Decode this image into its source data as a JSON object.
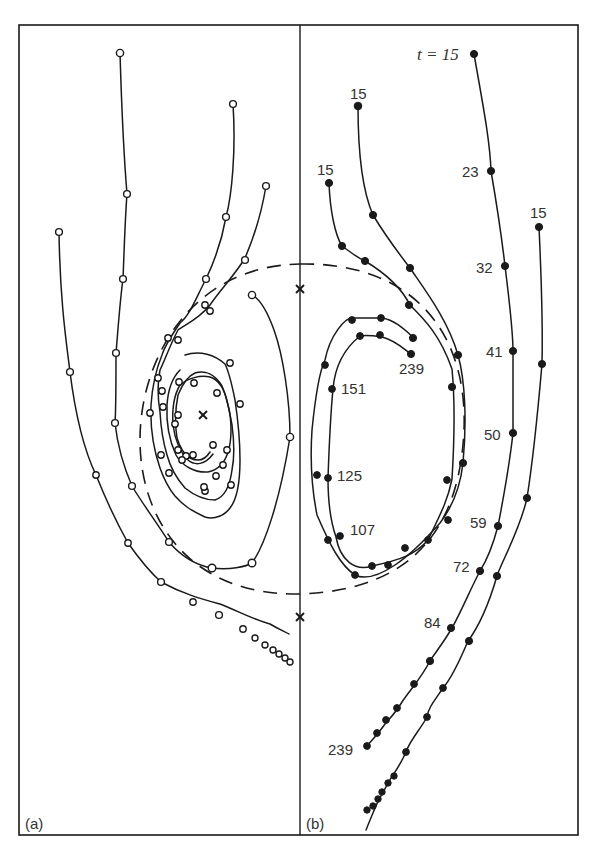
{
  "figure": {
    "panels": [
      {
        "id": "a",
        "label": "(a)",
        "marker": "open-circle"
      },
      {
        "id": "b",
        "label": "(b)",
        "marker": "filled-circle"
      }
    ],
    "time_labels": {
      "t_prefix": "t = 15",
      "outer_right_start": "15",
      "inner_left_start": "15",
      "mid_left_start": "15",
      "t23": "23",
      "t32": "32",
      "t41": "41",
      "t50": "50",
      "t59": "59",
      "t72": "72",
      "t84": "84",
      "t239_outer": "239",
      "t239_inner": "239",
      "t151": "151",
      "t125": "125",
      "t107": "107"
    },
    "fixed_points": [
      {
        "name": "saddle-upper",
        "x": 300,
        "y": 289
      },
      {
        "name": "saddle-lower",
        "x": 300,
        "y": 617
      },
      {
        "name": "focus-center",
        "x": 203,
        "y": 415
      }
    ],
    "separatrix": {
      "style": "dashed",
      "shape": "ellipse",
      "cx": 300,
      "cy": 430,
      "rx": 158,
      "ry": 165
    }
  }
}
